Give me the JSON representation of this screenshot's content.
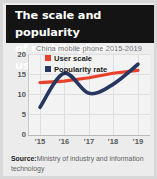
{
  "card": {
    "background": "#ececed",
    "border_color": "#d8d8d8"
  },
  "banner": {
    "title": "The scale and popularity\nof mobile phone users",
    "background": "#141414",
    "text_color": "#ffffff"
  },
  "subtitle": "China mobile phone 2015-2019",
  "legend": [
    {
      "label": "User scale",
      "color": "#e8402a",
      "swatch": "legend-swatch"
    },
    {
      "label": "Popularity rate",
      "color": "#26365f",
      "swatch": "legend-swatch"
    }
  ],
  "source": {
    "label": "Source:",
    "text": "Ministry of industry and information technology"
  },
  "chart_data": {
    "type": "line",
    "title": "The scale and popularity of mobile phone users",
    "subtitle": "China mobile phone 2015-2019",
    "xlabel": "",
    "ylabel": "",
    "x": [
      "2015",
      "2016",
      "2017",
      "2018",
      "2019"
    ],
    "categories": [
      "'15",
      "'16",
      "'17",
      "'18",
      "'19"
    ],
    "ylim": [
      0,
      20
    ],
    "yticks": [
      0,
      5,
      10,
      15,
      20
    ],
    "ytick_labels": [
      "0",
      "5",
      "10",
      "15",
      "20"
    ],
    "grid": true,
    "legend_position": "top-left",
    "series": [
      {
        "name": "User scale",
        "color": "#e8402a",
        "values": [
          13.0,
          13.4,
          14.2,
          15.3,
          16.0
        ],
        "smooth": false
      },
      {
        "name": "Popularity rate",
        "color": "#26365f",
        "values": [
          7.0,
          15.3,
          10.4,
          12.6,
          17.5
        ],
        "smooth": true
      }
    ],
    "source": "Source: Ministry of industry and information technology"
  }
}
